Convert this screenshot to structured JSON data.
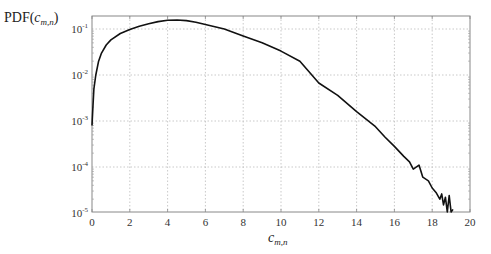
{
  "chart_data": {
    "type": "line",
    "title": "",
    "xlabel": "c_{m,n}",
    "ylabel": "PDF(c_{m,n})",
    "xscale": "linear",
    "yscale": "log",
    "xlim": [
      0,
      20
    ],
    "ylim": [
      1e-05,
      0.3
    ],
    "grid": true,
    "legend": null,
    "x_ticks": [
      0,
      2,
      4,
      6,
      8,
      10,
      12,
      14,
      16,
      18,
      20
    ],
    "x_tick_labels": [
      "0",
      "2",
      "4",
      "6",
      "8",
      "10",
      "12",
      "14",
      "16",
      "18",
      "20"
    ],
    "y_ticks": [
      1e-05,
      0.0001,
      0.001,
      0.01,
      0.1
    ],
    "y_tick_labels": [
      "10^-5",
      "10^-4",
      "10^-3",
      "10^-2",
      "10^-1"
    ],
    "series": [
      {
        "name": "PDF",
        "color": "#111111",
        "x": [
          0.0,
          0.05,
          0.1,
          0.2,
          0.35,
          0.5,
          0.75,
          1.0,
          1.5,
          2.0,
          2.5,
          3.0,
          3.5,
          4.0,
          4.5,
          5.0,
          5.5,
          6.0,
          7.0,
          8.0,
          9.0,
          10.0,
          11.0,
          12.0,
          13.0,
          14.0,
          15.0,
          15.5,
          16.0,
          16.5,
          16.8,
          17.0,
          17.3,
          17.5,
          17.8,
          18.0,
          18.2,
          18.4,
          18.5,
          18.6,
          18.7,
          18.8,
          18.9,
          19.0,
          19.1
        ],
        "y": [
          0.0008,
          0.002,
          0.005,
          0.01,
          0.02,
          0.03,
          0.045,
          0.058,
          0.08,
          0.097,
          0.115,
          0.13,
          0.145,
          0.155,
          0.157,
          0.152,
          0.14,
          0.125,
          0.1,
          0.07,
          0.05,
          0.033,
          0.02,
          0.0067,
          0.0036,
          0.0016,
          0.00075,
          0.00045,
          0.00028,
          0.00017,
          0.00013,
          9e-05,
          0.00011,
          6e-05,
          5e-05,
          3.5e-05,
          2.8e-05,
          2e-05,
          2.6e-05,
          1.5e-05,
          2.2e-05,
          1e-05,
          2.4e-05,
          1e-05,
          1.2e-05
        ]
      }
    ]
  },
  "labels": {
    "y_axis_prefix": "PDF(",
    "y_axis_var": "c",
    "y_axis_sub": "m,n",
    "y_axis_suffix": ")",
    "x_axis_var": "c",
    "x_axis_sub": "m,n"
  }
}
